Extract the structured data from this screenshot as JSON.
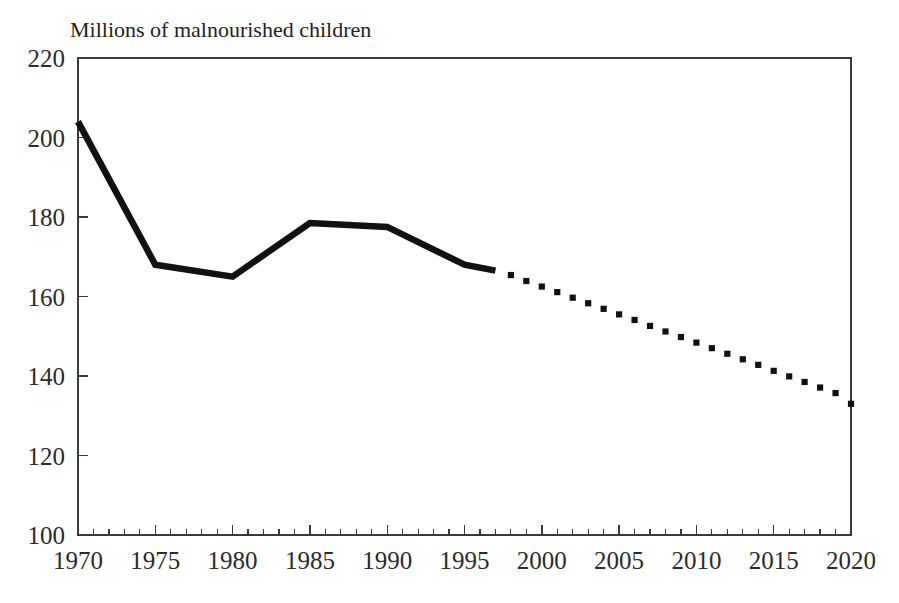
{
  "chart_data": {
    "type": "line",
    "title": "Millions of malnourished children",
    "xlabel": "",
    "ylabel": "Millions of malnourished children",
    "xlim": [
      1970,
      2020
    ],
    "ylim": [
      100,
      220
    ],
    "grid": false,
    "legend": "none",
    "x_ticks": [
      1970,
      1975,
      1980,
      1985,
      1990,
      1995,
      2000,
      2005,
      2010,
      2015,
      2020
    ],
    "x_tick_labels": [
      "1970",
      "1975",
      "1980",
      "1985",
      "1990",
      "1995",
      "2000",
      "2005",
      "2010",
      "2015",
      "2020"
    ],
    "x_minor_tick_step": 1,
    "y_ticks": [
      100,
      120,
      140,
      160,
      180,
      200,
      220
    ],
    "y_tick_labels": [
      "100",
      "120",
      "140",
      "160",
      "180",
      "200",
      "220"
    ],
    "series": [
      {
        "name": "Historical",
        "style": "solid",
        "color": "#111111",
        "x": [
          1970,
          1975,
          1980,
          1985,
          1990,
          1995,
          1997
        ],
        "values": [
          204,
          168,
          165,
          178.5,
          177.5,
          168,
          166.5
        ]
      },
      {
        "name": "Projection",
        "style": "dotted",
        "color": "#111111",
        "x": [
          1998,
          1999,
          2000,
          2001,
          2002,
          2003,
          2004,
          2005,
          2006,
          2007,
          2008,
          2009,
          2010,
          2011,
          2012,
          2013,
          2014,
          2015,
          2016,
          2017,
          2018,
          2019,
          2020
        ],
        "values": [
          165.4,
          163.9,
          162.5,
          161.1,
          159.7,
          158.3,
          156.9,
          155.5,
          154.1,
          152.6,
          151.2,
          149.8,
          148.4,
          147.0,
          145.6,
          144.2,
          142.8,
          141.3,
          139.9,
          138.5,
          137.1,
          135.7,
          133.0
        ]
      }
    ]
  },
  "geometry": {
    "plot_left": 78,
    "plot_right": 851,
    "plot_top": 58,
    "plot_bottom": 535,
    "title_x": 70,
    "title_y": 37,
    "tick_len_major": 10,
    "tick_len_minor": 6
  }
}
